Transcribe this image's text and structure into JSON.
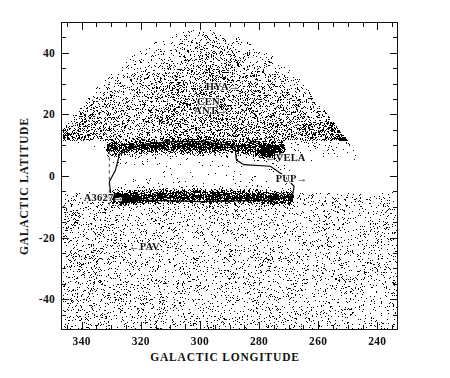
{
  "figure": {
    "kind": "scatter-sky-plot",
    "background_color": "#ffffff",
    "point_color": "#000000",
    "frame_color": "#111111"
  },
  "axes": {
    "x_title": "GALACTIC LONGITUDE",
    "y_title": "GALACTIC LATITUDE",
    "x_ticklabels": [
      "340",
      "320",
      "300",
      "280",
      "260",
      "240"
    ],
    "y_ticklabels": [
      "40",
      "20",
      "0",
      "-20",
      "-40"
    ]
  },
  "annotations": [
    {
      "label": "HYA→",
      "name": "annotation-hya"
    },
    {
      "label": "CEN",
      "name": "annotation-cen"
    },
    {
      "label": "ANT→",
      "name": "annotation-ant"
    },
    {
      "label": "←VELA",
      "name": "annotation-vela"
    },
    {
      "label": "PUP→",
      "name": "annotation-pup"
    },
    {
      "label": "A3627→",
      "name": "annotation-a3627"
    },
    {
      "label": "←PAV",
      "name": "annotation-pav"
    }
  ],
  "chart_data": {
    "type": "scatter",
    "title": "",
    "xlabel": "GALACTIC LONGITUDE",
    "ylabel": "GALACTIC LATITUDE",
    "xlim": [
      347,
      233
    ],
    "ylim": [
      -50,
      50
    ],
    "x_ticks": [
      340,
      320,
      300,
      280,
      260,
      240
    ],
    "y_ticks": [
      40,
      20,
      0,
      -20,
      -40
    ],
    "x_minor_tick_step": 5,
    "y_minor_tick_step": 5,
    "x_axis_inverted": true,
    "grid": false,
    "legend": null,
    "n_points_approx": 9000,
    "marker": "dot",
    "marker_size_px": 1.3,
    "series": [
      {
        "name": "galaxies",
        "description": "Optically selected galaxies plotted in galactic coordinates; density dome-limited above b=+10 and uniform below the plane.",
        "color": "#000000"
      },
      {
        "name": "zone-of-avoidance-band",
        "description": "Heavily obscured dense strip of galaxies concentrated along the galactic plane between b=-6 and b=+10.",
        "color": "#000000"
      }
    ],
    "annotations": [
      {
        "text": "HYA→",
        "l": 288,
        "b": 29,
        "arrow": "right"
      },
      {
        "text": "CEN",
        "l": 301,
        "b": 24,
        "arrow": "none"
      },
      {
        "text": "ANT→",
        "l": 292,
        "b": 21,
        "arrow": "right"
      },
      {
        "text": "←VELA",
        "l": 278,
        "b": 6,
        "arrow": "left"
      },
      {
        "text": "PUP→",
        "l": 265,
        "b": -1,
        "arrow": "right"
      },
      {
        "text": "A3627→",
        "l": 327,
        "b": -7,
        "arrow": "right"
      },
      {
        "text": "←PAV",
        "l": 324,
        "b": -23,
        "arrow": "left"
      }
    ],
    "survey_polygon": {
      "description": "Outline of the surveyed zone-of-avoidance strip",
      "vertices_lb": [
        [
          330.5,
          -5.5
        ],
        [
          331.0,
          -1.5
        ],
        [
          329.0,
          2.0
        ],
        [
          327.5,
          7.5
        ],
        [
          320.0,
          10.5
        ],
        [
          310.0,
          11.5
        ],
        [
          300.0,
          11.5
        ],
        [
          292.0,
          10.5
        ],
        [
          288.5,
          10.0
        ],
        [
          288.0,
          5.5
        ],
        [
          285.5,
          4.0
        ],
        [
          276.5,
          3.5
        ],
        [
          272.0,
          0.5
        ],
        [
          268.5,
          -3.0
        ],
        [
          269.0,
          -6.0
        ],
        [
          276.0,
          -7.5
        ],
        [
          300.0,
          -8.0
        ],
        [
          320.0,
          -7.5
        ],
        [
          330.5,
          -5.5
        ]
      ]
    },
    "dashed_reference_line": {
      "description": "Vertical dashed reference line",
      "l": 331.0,
      "b_range": [
        -10.5,
        10.5
      ]
    }
  }
}
